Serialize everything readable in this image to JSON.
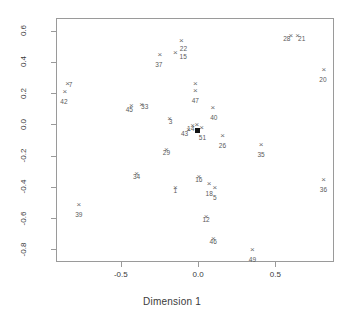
{
  "chart_data": {
    "type": "scatter",
    "title": "",
    "xlabel": "Dimension 1",
    "ylabel": "Dimension 2",
    "xlim": [
      -0.92,
      0.88
    ],
    "ylim": [
      -0.88,
      0.68
    ],
    "xticks": [
      "-0.5",
      "0.0",
      "0.5"
    ],
    "xtick_values": [
      -0.5,
      0.0,
      0.5
    ],
    "yticks": [
      "0.6",
      "0.4",
      "0.2",
      "0.0",
      "-0.2",
      "-0.4",
      "-0.6",
      "-0.8"
    ],
    "ytick_values": [
      0.6,
      0.4,
      0.2,
      0.0,
      -0.2,
      -0.4,
      -0.6,
      -0.8
    ],
    "grid": false,
    "legend": "none",
    "marker": "x",
    "point_color": "#6b6b6b",
    "label_color": "#5a5a5a",
    "axis_color": "#9a9a9a",
    "points": [
      {
        "label": "28",
        "x": 0.6,
        "y": 0.565,
        "marker": "x",
        "lab_dx": -4,
        "lab_dy": 1
      },
      {
        "label": "21",
        "x": 0.645,
        "y": 0.565,
        "marker": "x",
        "lab_dx": 4,
        "lab_dy": 1
      },
      {
        "label": "22",
        "x": -0.108,
        "y": 0.535,
        "marker": "x",
        "lab_dx": 2,
        "lab_dy": 6
      },
      {
        "label": "15",
        "x": -0.148,
        "y": 0.455,
        "marker": "x",
        "lab_dx": 8,
        "lab_dy": 2
      },
      {
        "label": "37",
        "x": -0.248,
        "y": 0.445,
        "marker": "x",
        "lab_dx": -1,
        "lab_dy": 8
      },
      {
        "label": "20",
        "x": 0.815,
        "y": 0.345,
        "marker": "x",
        "lab_dx": -1,
        "lab_dy": 8
      },
      {
        "label": "7",
        "x": -0.845,
        "y": 0.255,
        "marker": "x",
        "lab_dx": 3,
        "lab_dy": -1
      },
      {
        "label": "47",
        "x": -0.018,
        "y": 0.255,
        "marker": "x",
        "lab_dx": 0,
        "lab_dy": 15
      },
      {
        "label": "34x",
        "x": -0.018,
        "y": 0.215,
        "marker": "x",
        "lab_dx": 0,
        "lab_dy": 0,
        "hide_label": true
      },
      {
        "label": "42",
        "x": -0.862,
        "y": 0.205,
        "marker": "x",
        "lab_dx": -1,
        "lab_dy": 8
      },
      {
        "label": "33",
        "x": -0.365,
        "y": 0.125,
        "marker": "x",
        "lab_dx": 3,
        "lab_dy": 0
      },
      {
        "label": "45",
        "x": -0.432,
        "y": 0.118,
        "marker": "x",
        "lab_dx": -2,
        "lab_dy": 2
      },
      {
        "label": "40",
        "x": 0.095,
        "y": 0.105,
        "marker": "x",
        "lab_dx": 1,
        "lab_dy": 8
      },
      {
        "label": "3",
        "x": -0.185,
        "y": 0.035,
        "marker": "x",
        "lab_dx": 1,
        "lab_dy": 1
      },
      {
        "label": "14",
        "x": -0.035,
        "y": -0.01,
        "marker": "x",
        "lab_dx": -2,
        "lab_dy": 1
      },
      {
        "label": "x1",
        "x": -0.008,
        "y": -0.005,
        "marker": "x",
        "lab_dx": 0,
        "lab_dy": 0,
        "hide_label": true
      },
      {
        "label": "43",
        "x": -0.062,
        "y": -0.035,
        "marker": "x",
        "lab_dx": -4,
        "lab_dy": 2
      },
      {
        "label": "51",
        "x": 0.022,
        "y": -0.025,
        "marker": "x",
        "lab_dx": 1,
        "lab_dy": 8
      },
      {
        "label": "ctr",
        "x": -0.005,
        "y": -0.04,
        "marker": "square",
        "lab_dx": 0,
        "lab_dy": 0,
        "hide_label": true
      },
      {
        "label": "26",
        "x": 0.158,
        "y": -0.075,
        "marker": "x",
        "lab_dx": 0,
        "lab_dy": 8
      },
      {
        "label": "35",
        "x": 0.408,
        "y": -0.135,
        "marker": "x",
        "lab_dx": 0,
        "lab_dy": 8
      },
      {
        "label": "29",
        "x": -0.205,
        "y": -0.165,
        "marker": "x",
        "lab_dx": 0,
        "lab_dy": 1
      },
      {
        "label": "34",
        "x": -0.398,
        "y": -0.318,
        "marker": "x",
        "lab_dx": 0,
        "lab_dy": 1
      },
      {
        "label": "16",
        "x": 0.005,
        "y": -0.335,
        "marker": "x",
        "lab_dx": 0,
        "lab_dy": 1
      },
      {
        "label": "36",
        "x": 0.812,
        "y": -0.355,
        "marker": "x",
        "lab_dx": 0,
        "lab_dy": 8
      },
      {
        "label": "18",
        "x": 0.072,
        "y": -0.382,
        "marker": "x",
        "lab_dx": 0,
        "lab_dy": 8
      },
      {
        "label": "1",
        "x": -0.148,
        "y": -0.405,
        "marker": "x",
        "lab_dx": 0,
        "lab_dy": 1
      },
      {
        "label": "5",
        "x": 0.108,
        "y": -0.408,
        "marker": "x",
        "lab_dx": 0,
        "lab_dy": 8
      },
      {
        "label": "39",
        "x": -0.772,
        "y": -0.518,
        "marker": "x",
        "lab_dx": 0,
        "lab_dy": 8
      },
      {
        "label": "12",
        "x": 0.052,
        "y": -0.595,
        "marker": "x",
        "lab_dx": 0,
        "lab_dy": 1
      },
      {
        "label": "46",
        "x": 0.098,
        "y": -0.735,
        "marker": "x",
        "lab_dx": 0,
        "lab_dy": 1
      },
      {
        "label": "49",
        "x": 0.352,
        "y": -0.805,
        "marker": "x",
        "lab_dx": 0,
        "lab_dy": 8
      }
    ]
  }
}
